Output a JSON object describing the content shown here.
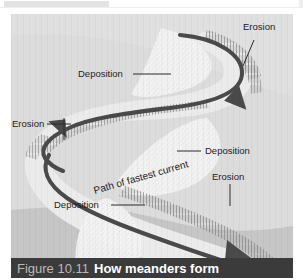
{
  "figure": {
    "caption_number": "Figure 10.11",
    "caption_title": "How meanders form",
    "labels": [
      {
        "id": "erosion-top-right",
        "text": "Erosion"
      },
      {
        "id": "deposition-top-left",
        "text": "Deposition"
      },
      {
        "id": "erosion-left",
        "text": "Erosion"
      },
      {
        "id": "deposition-middle-right",
        "text": "Deposition"
      },
      {
        "id": "erosion-right",
        "text": "Erosion"
      },
      {
        "id": "path-of-fastest-current",
        "text": "Path of fastest current"
      },
      {
        "id": "deposition-bottom-left",
        "text": "Deposition"
      }
    ],
    "colors": {
      "background_upper": "#dcdcdc",
      "background_lower": "#c6c6c6",
      "channel_water": "#e9e9e9",
      "point_bar_sand": "#f2f2f2",
      "cut_bank_hatch": "#8e8e8e",
      "current_arrow": "#4a4a4a",
      "leader_line": "#2a2a2a",
      "caption_bar": "#3b3b3b",
      "caption_number_text": "#b9b9b9",
      "caption_title_text": "#ffffff",
      "label_text": "#1c1c1c"
    }
  }
}
